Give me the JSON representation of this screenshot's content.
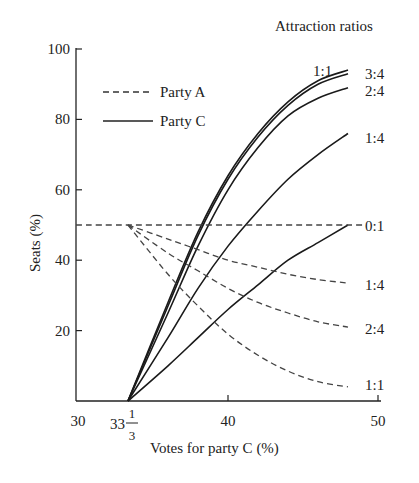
{
  "chart_data": {
    "type": "line",
    "title": "",
    "xlabel": "Votes for party C (%)",
    "ylabel": "Seats (%)",
    "xlim": [
      30,
      50
    ],
    "ylim": [
      0,
      100
    ],
    "x_ticks": [
      "30",
      "33 1/3",
      "40",
      "50"
    ],
    "y_ticks": [
      "20",
      "40",
      "60",
      "80",
      "100"
    ],
    "grid": false,
    "legend": {
      "position": "upper-left",
      "entries": [
        {
          "label": "Party A",
          "style": "dashed"
        },
        {
          "label": "Party C",
          "style": "solid"
        }
      ]
    },
    "annotation_header": "Attraction ratios",
    "x": [
      33.33,
      36,
      38,
      40,
      42,
      44,
      46,
      48
    ],
    "series": [
      {
        "name": "Party C 1:1",
        "party": "C",
        "ratio": "1:1",
        "style": "solid",
        "values": [
          0,
          28,
          48,
          64,
          76,
          85,
          91,
          94
        ]
      },
      {
        "name": "Party C 3:4",
        "party": "C",
        "ratio": "3:4",
        "style": "solid",
        "values": [
          0,
          27,
          47,
          63,
          75,
          84,
          90,
          93
        ]
      },
      {
        "name": "Party C 2:4",
        "party": "C",
        "ratio": "2:4",
        "style": "solid",
        "values": [
          0,
          25,
          44,
          60,
          72,
          81,
          86,
          89
        ]
      },
      {
        "name": "Party C 1:4",
        "party": "C",
        "ratio": "1:4",
        "style": "solid",
        "values": [
          0,
          18,
          32,
          44,
          54,
          63,
          70,
          76
        ]
      },
      {
        "name": "Party C 0:1",
        "party": "C",
        "ratio": "0:1",
        "style": "solid",
        "values": [
          0,
          10,
          18,
          26,
          33,
          40,
          45,
          50
        ]
      },
      {
        "name": "Party A 0:1",
        "party": "A",
        "ratio": "0:1",
        "style": "dashed",
        "values": [
          50,
          50,
          50,
          50,
          50,
          50,
          50,
          50
        ]
      },
      {
        "name": "Party A 1:4",
        "party": "A",
        "ratio": "1:4",
        "style": "dashed",
        "values": [
          50,
          46,
          43,
          40,
          38,
          36,
          34.5,
          33.5
        ]
      },
      {
        "name": "Party A 2:4",
        "party": "A",
        "ratio": "2:4",
        "style": "dashed",
        "values": [
          50,
          42,
          37,
          32,
          28,
          25,
          22.5,
          21
        ]
      },
      {
        "name": "Party A 1:1",
        "party": "A",
        "ratio": "1:1",
        "style": "dashed",
        "values": [
          50,
          36,
          27,
          19,
          13,
          8.5,
          5.5,
          4
        ]
      }
    ],
    "end_labels": [
      "1:1",
      "3:4",
      "2:4",
      "1:4",
      "0:1",
      "1:4",
      "2:4",
      "1:1"
    ]
  }
}
